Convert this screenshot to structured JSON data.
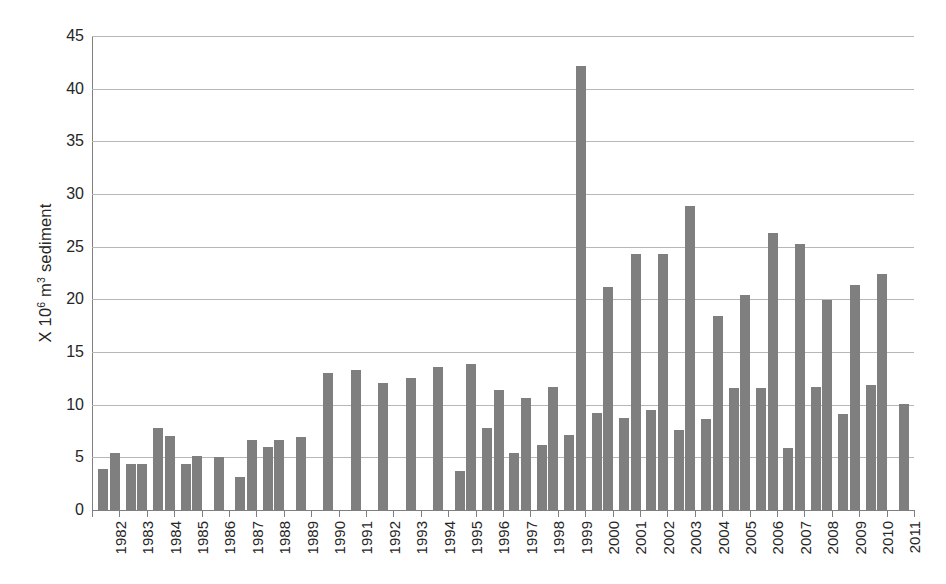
{
  "chart_data": {
    "type": "bar",
    "title": "",
    "xlabel": "",
    "ylabel_plain": "X 10^6 m^3 sediment",
    "ylabel_parts": {
      "prefix": "X 10",
      "exponent": "6",
      "mid": " m",
      "exponent2": "3",
      "suffix": " sediment"
    },
    "ylim": [
      0,
      45
    ],
    "ytick_step": 5,
    "yticks": [
      45,
      40,
      35,
      30,
      25,
      20,
      15,
      10,
      5,
      0
    ],
    "grid": true,
    "grid_axis": "y",
    "legend": "none",
    "bar_color": "#7f7f7f",
    "grid_color": "#b7b7b7",
    "axis_color": "#7f7f7f",
    "text_color": "#262626",
    "categories": [
      "1982",
      "1983",
      "1984",
      "1985",
      "1986",
      "1987",
      "1988",
      "1989",
      "1990",
      "1991",
      "1992",
      "1993",
      "1994",
      "1995",
      "1996",
      "1997",
      "1998",
      "1999",
      "2000",
      "2001",
      "2002",
      "2003",
      "2004",
      "2005",
      "2006",
      "2007",
      "2008",
      "2009",
      "2010",
      "2011"
    ],
    "series": [
      {
        "name": "Series 1",
        "values": [
          3.9,
          4.4,
          7.8,
          4.4,
          null,
          3.1,
          6.0,
          null,
          null,
          null,
          null,
          null,
          null,
          3.7,
          7.8,
          5.4,
          6.2,
          7.1,
          9.2,
          8.7,
          9.5,
          7.6,
          8.6,
          11.6,
          11.6,
          5.9,
          11.7,
          9.1,
          11.9,
          null
        ]
      },
      {
        "name": "Series 2",
        "values": [
          5.4,
          4.4,
          7.0,
          5.1,
          5.0,
          6.6,
          6.6,
          6.9,
          13.0,
          13.3,
          12.1,
          12.5,
          13.6,
          13.9,
          11.4,
          10.6,
          11.7,
          42.2,
          21.2,
          24.3,
          24.3,
          28.9,
          18.4,
          20.4,
          26.3,
          25.3,
          19.9,
          21.4,
          22.4,
          10.1
        ]
      }
    ]
  }
}
